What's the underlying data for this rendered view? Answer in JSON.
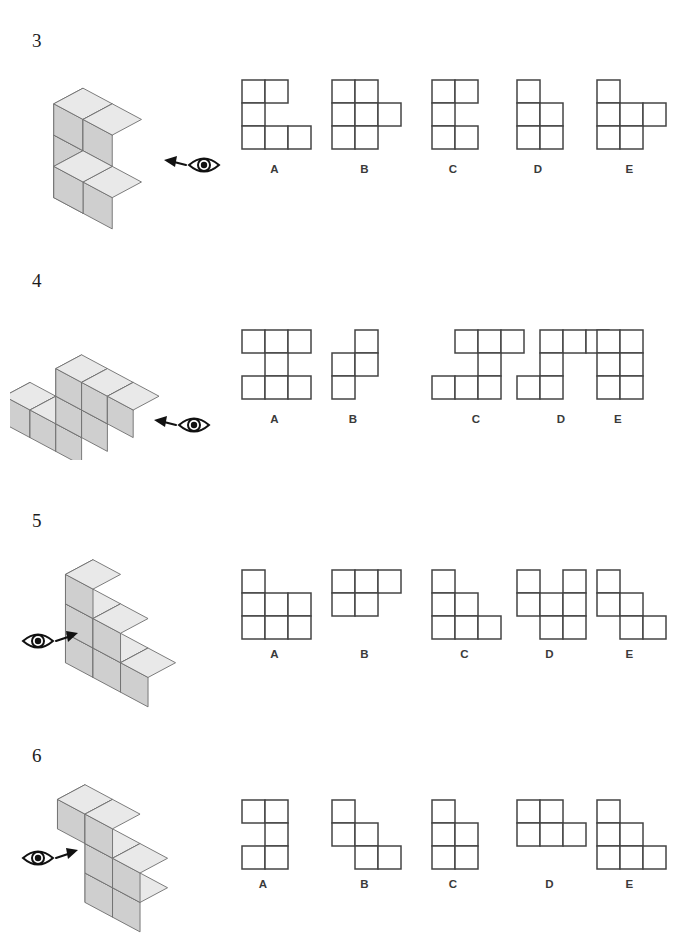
{
  "page": {
    "background": "#ffffff",
    "line_color": "#444444",
    "label_color": "#3a3a3a",
    "cube_top": "#e9e9e9",
    "cube_left": "#b6b6b6",
    "cube_right": "#cfcfcf",
    "cube_edge": "#6e6e6e"
  },
  "cell_size": 23,
  "questions": [
    {
      "number": "3",
      "eye_icon": "eye-icon",
      "arrow_icon": "arrow-left-icon",
      "view_direction": "left",
      "figure": {
        "name": "cube-figure-3",
        "cubes": [
          {
            "x": 0,
            "y": 0,
            "z": 2
          },
          {
            "x": 1,
            "y": 0,
            "z": 2
          },
          {
            "x": 0,
            "y": 0,
            "z": 1
          },
          {
            "x": 0,
            "y": 0,
            "z": 0
          },
          {
            "x": 1,
            "y": 0,
            "z": 0
          },
          {
            "x": 1,
            "y": 1,
            "z": 1
          }
        ]
      },
      "options": [
        {
          "label": "A",
          "name": "option-a",
          "rows": [
            [
              0,
              1
            ],
            [
              0
            ],
            [
              0,
              1,
              2
            ]
          ],
          "cols": 3
        },
        {
          "label": "B",
          "name": "option-b",
          "rows": [
            [
              0,
              1
            ],
            [
              0,
              1,
              2
            ],
            [
              0,
              1
            ]
          ],
          "cols": 3
        },
        {
          "label": "C",
          "name": "option-c",
          "rows": [
            [
              0,
              1
            ],
            [
              0
            ],
            [
              0,
              1
            ]
          ],
          "cols": 2
        },
        {
          "label": "D",
          "name": "option-d",
          "rows": [
            [
              0
            ],
            [
              0,
              1
            ],
            [
              0,
              1
            ]
          ],
          "cols": 2
        },
        {
          "label": "E",
          "name": "option-e",
          "rows": [
            [
              0
            ],
            [
              0,
              1,
              2
            ],
            [
              0,
              1
            ]
          ],
          "cols": 3
        }
      ]
    },
    {
      "number": "4",
      "eye_icon": "eye-icon",
      "arrow_icon": "arrow-left-icon",
      "view_direction": "left",
      "figure": {
        "name": "cube-figure-4",
        "cubes": [
          {
            "x": 2,
            "y": 0,
            "z": 2
          },
          {
            "x": 3,
            "y": 0,
            "z": 2
          },
          {
            "x": 4,
            "y": 0,
            "z": 2
          },
          {
            "x": 2,
            "y": 0,
            "z": 1
          },
          {
            "x": 3,
            "y": 0,
            "z": 1
          },
          {
            "x": 0,
            "y": 0,
            "z": 0
          },
          {
            "x": 1,
            "y": 0,
            "z": 0
          },
          {
            "x": 2,
            "y": 0,
            "z": 0
          }
        ]
      },
      "options": [
        {
          "label": "A",
          "name": "option-a",
          "rows": [
            [
              0,
              1,
              2
            ],
            [
              1
            ],
            [
              0,
              1,
              2
            ]
          ],
          "cols": 3
        },
        {
          "label": "B",
          "name": "option-b",
          "rows": [
            [
              1
            ],
            [
              0,
              1
            ],
            [
              0
            ]
          ],
          "cols": 2
        },
        {
          "label": "C",
          "name": "option-c",
          "rows": [
            [
              1,
              2,
              3
            ],
            [
              2
            ],
            [
              0,
              1,
              2
            ]
          ],
          "cols": 4
        },
        {
          "label": "D",
          "name": "option-d",
          "rows": [
            [
              1,
              2,
              3
            ],
            [
              1
            ],
            [
              0,
              1
            ]
          ],
          "cols": 4
        },
        {
          "label": "E",
          "name": "option-e",
          "rows": [
            [
              0,
              1
            ],
            [
              0,
              1
            ],
            [
              0,
              1
            ]
          ],
          "cols": 2
        }
      ]
    },
    {
      "number": "5",
      "eye_icon": "eye-icon",
      "arrow_icon": "arrow-right-icon",
      "view_direction": "right",
      "figure": {
        "name": "cube-figure-5",
        "cubes": [
          {
            "x": 0,
            "y": 0,
            "z": 2
          },
          {
            "x": 0,
            "y": 0,
            "z": 1
          },
          {
            "x": 1,
            "y": 0,
            "z": 1
          },
          {
            "x": 0,
            "y": 0,
            "z": 0
          },
          {
            "x": 1,
            "y": 0,
            "z": 0
          },
          {
            "x": 2,
            "y": 0,
            "z": 0
          }
        ]
      },
      "options": [
        {
          "label": "A",
          "name": "option-a",
          "rows": [
            [
              0
            ],
            [
              0,
              1,
              2
            ],
            [
              0,
              1,
              2
            ]
          ],
          "cols": 3
        },
        {
          "label": "B",
          "name": "option-b",
          "rows": [
            [
              0,
              1,
              2
            ],
            [
              0,
              1
            ]
          ],
          "cols": 3
        },
        {
          "label": "C",
          "name": "option-c",
          "rows": [
            [
              0
            ],
            [
              0,
              1
            ],
            [
              0,
              1,
              2
            ]
          ],
          "cols": 3
        },
        {
          "label": "D",
          "name": "option-d",
          "rows": [
            [
              0,
              2
            ],
            [
              0,
              1,
              2
            ],
            [
              1,
              2
            ]
          ],
          "cols": 3
        },
        {
          "label": "E",
          "name": "option-e",
          "rows": [
            [
              0
            ],
            [
              0,
              1
            ],
            [
              1,
              2
            ]
          ],
          "cols": 3
        }
      ]
    },
    {
      "number": "6",
      "eye_icon": "eye-icon",
      "arrow_icon": "arrow-right-icon",
      "view_direction": "right",
      "figure": {
        "name": "cube-figure-6",
        "cubes": [
          {
            "x": 0,
            "y": 0,
            "z": 2
          },
          {
            "x": 1,
            "y": 0,
            "z": 2
          },
          {
            "x": 1,
            "y": 0,
            "z": 1
          },
          {
            "x": 2,
            "y": 0,
            "z": 1
          },
          {
            "x": 1,
            "y": 0,
            "z": 0
          },
          {
            "x": 2,
            "y": 0,
            "z": 0
          }
        ]
      },
      "options": [
        {
          "label": "A",
          "name": "option-a",
          "rows": [
            [
              0,
              1
            ],
            [
              1
            ],
            [
              0,
              1
            ]
          ],
          "cols": 2
        },
        {
          "label": "B",
          "name": "option-b",
          "rows": [
            [
              0
            ],
            [
              0,
              1
            ],
            [
              1,
              2
            ]
          ],
          "cols": 3
        },
        {
          "label": "C",
          "name": "option-c",
          "rows": [
            [
              0
            ],
            [
              0,
              1
            ],
            [
              0,
              1
            ]
          ],
          "cols": 2
        },
        {
          "label": "D",
          "name": "option-d",
          "rows": [
            [
              0,
              1
            ],
            [
              0,
              1,
              2
            ]
          ],
          "cols": 3
        },
        {
          "label": "E",
          "name": "option-e",
          "rows": [
            [
              0
            ],
            [
              0,
              1
            ],
            [
              0,
              1,
              2
            ]
          ],
          "cols": 3
        }
      ]
    }
  ],
  "layout": {
    "block_tops": [
      30,
      270,
      510,
      745
    ],
    "number_left": 32,
    "option_left_positions": [
      240,
      330,
      430,
      515,
      595
    ],
    "option_row_top": [
      78,
      328,
      568,
      798
    ],
    "option_label_top": [
      163,
      413,
      648,
      878
    ]
  }
}
